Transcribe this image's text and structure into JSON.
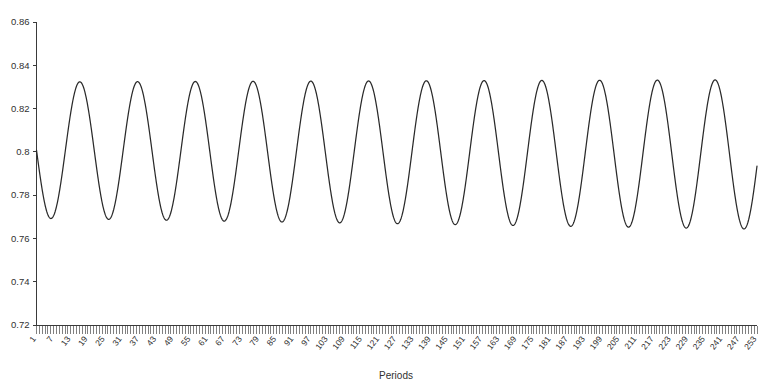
{
  "chart_data": {
    "type": "line",
    "title": "",
    "subtitle": "",
    "xlabel": "Periods",
    "ylabel": "",
    "xlim": [
      1,
      253
    ],
    "ylim": [
      0.72,
      0.86
    ],
    "grid": false,
    "legend": null,
    "line_color": "#2a2a2a",
    "background_color": "#ffffff",
    "y_ticks": [
      "0.72",
      "0.74",
      "0.76",
      "0.78",
      "0.8",
      "0.82",
      "0.84",
      "0.86"
    ],
    "y_tick_values": [
      0.72,
      0.74,
      0.76,
      0.78,
      0.8,
      0.82,
      0.84,
      0.86
    ],
    "x_ticks": [
      "1",
      "7",
      "13",
      "19",
      "25",
      "31",
      "37",
      "43",
      "49",
      "55",
      "61",
      "67",
      "73",
      "79",
      "85",
      "91",
      "97",
      "103",
      "109",
      "115",
      "121",
      "127",
      "133",
      "139",
      "145",
      "151",
      "157",
      "163",
      "169",
      "175",
      "181",
      "187",
      "193",
      "199",
      "205",
      "211",
      "217",
      "223",
      "229",
      "235",
      "241",
      "247",
      "253"
    ],
    "x_tick_step": 6,
    "x_minor_tick_count": 253,
    "series": [
      {
        "name": "series-1",
        "oscillation": {
          "center": 0.8008,
          "period": 20.2,
          "phase_offset": 0.0,
          "amplitude_start": 0.0315,
          "amplitude_end": 0.0345,
          "center_drift_end": 0.7988,
          "initial_value": 0.8002,
          "first_trough_value": 0.7722,
          "peak_value_typical": 0.833,
          "trough_value_early": 0.7705,
          "trough_value_late": 0.7645,
          "final_value": 0.7915,
          "cycles_visible": 12.5
        },
        "x": [
          1,
          7,
          13,
          19,
          25,
          31,
          37,
          43,
          49,
          55,
          61,
          67,
          73,
          79,
          85,
          91,
          97,
          103,
          109,
          115,
          121,
          127,
          133,
          139,
          145,
          151,
          157,
          163,
          169,
          175,
          181,
          187,
          193,
          199,
          205,
          211,
          217,
          223,
          229,
          235,
          241,
          247,
          253
        ],
        "values": [
          0.8002,
          0.7745,
          0.828,
          0.8185,
          0.7715,
          0.809,
          0.832,
          0.779,
          0.7845,
          0.833,
          0.793,
          0.77,
          0.829,
          0.812,
          0.7705,
          0.818,
          0.8295,
          0.773,
          0.793,
          0.8325,
          0.7845,
          0.7705,
          0.8325,
          0.801,
          0.77,
          0.827,
          0.82,
          0.77,
          0.808,
          0.833,
          0.7775,
          0.7835,
          0.8335,
          0.7915,
          0.766,
          0.83,
          0.8115,
          0.766,
          0.82,
          0.83,
          0.769,
          0.795,
          0.7915
        ]
      }
    ]
  },
  "axes": {
    "x_axis_title": "Periods"
  }
}
